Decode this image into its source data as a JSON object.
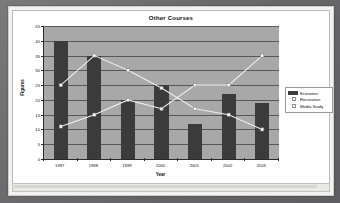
{
  "window": {
    "page_label": "chart-slide"
  },
  "chart": {
    "title": "Other Courses",
    "x_axis_title": "Year",
    "y_axis_title": "Figures",
    "legend": [
      {
        "label": "Economic",
        "marker": "bar-swatch",
        "color": "#3b3b3b"
      },
      {
        "label": "Recreation",
        "marker": "line-swatch",
        "color": "#ededed"
      },
      {
        "label": "Media Study",
        "marker": "line-swatch",
        "color": "#f0f0f0"
      }
    ]
  },
  "chart_data": {
    "type": "bar",
    "title": "Other Courses",
    "xlabel": "Year",
    "ylabel": "Figures",
    "categories": [
      "1997",
      "1998",
      "1999",
      "2000",
      "2001",
      "2002",
      "2003"
    ],
    "ylim": [
      0,
      45
    ],
    "yticks": [
      0,
      5,
      10,
      15,
      20,
      25,
      30,
      35,
      40,
      45
    ],
    "grid": true,
    "legend_position": "right",
    "series": [
      {
        "name": "Economic",
        "type": "bar",
        "color": "#3b3b3b",
        "values": [
          40,
          35,
          20,
          25,
          12,
          22,
          19
        ]
      },
      {
        "name": "Recreation",
        "type": "line",
        "color": "#ededed",
        "values": [
          25,
          35,
          30,
          24,
          17,
          15,
          10
        ]
      },
      {
        "name": "Media Study",
        "type": "line",
        "color": "#f0f0f0",
        "values": [
          11,
          15,
          20,
          17,
          25,
          25,
          35
        ]
      }
    ]
  }
}
